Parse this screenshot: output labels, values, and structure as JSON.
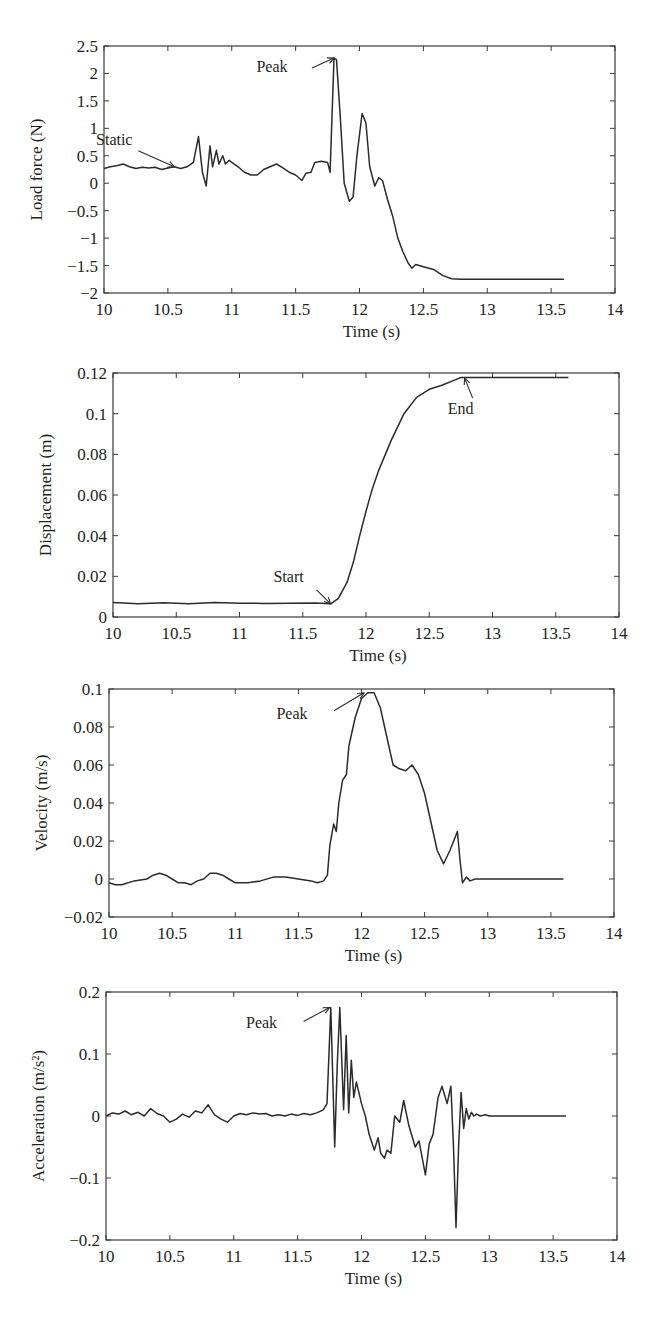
{
  "chart_data": [
    {
      "type": "line",
      "title": "",
      "xlabel": "Time (s)",
      "ylabel": "Load force (N)",
      "xlim": [
        10,
        14
      ],
      "ylim": [
        -2,
        2.5
      ],
      "xticks": [
        "10",
        "10.5",
        "11",
        "11.5",
        "12",
        "12.5",
        "13",
        "13.5",
        "14"
      ],
      "yticks": [
        "-2",
        "-1.5",
        "-1",
        "-0.5",
        "0",
        "0.5",
        "1",
        "1.5",
        "2",
        "2.5"
      ],
      "grid": false,
      "annotations": [
        {
          "text": "Static",
          "x": 10.55,
          "y": 0.3
        },
        {
          "text": "Peak",
          "x": 11.8,
          "y": 2.28
        }
      ],
      "series": [
        {
          "name": "Load force",
          "x": [
            10,
            10.05,
            10.1,
            10.15,
            10.2,
            10.25,
            10.3,
            10.35,
            10.4,
            10.45,
            10.5,
            10.55,
            10.6,
            10.65,
            10.7,
            10.74,
            10.77,
            10.8,
            10.83,
            10.85,
            10.88,
            10.9,
            10.93,
            10.95,
            10.98,
            11.0,
            11.05,
            11.1,
            11.15,
            11.2,
            11.25,
            11.3,
            11.35,
            11.4,
            11.45,
            11.5,
            11.55,
            11.58,
            11.62,
            11.65,
            11.7,
            11.75,
            11.77,
            11.8,
            11.82,
            11.85,
            11.88,
            11.92,
            11.95,
            11.98,
            12.02,
            12.05,
            12.08,
            12.12,
            12.15,
            12.18,
            12.22,
            12.26,
            12.3,
            12.34,
            12.38,
            12.41,
            12.44,
            12.5,
            12.58,
            12.65,
            12.72,
            12.8,
            13.0,
            13.2,
            13.4,
            13.6
          ],
          "y": [
            0.27,
            0.3,
            0.32,
            0.35,
            0.3,
            0.27,
            0.29,
            0.28,
            0.29,
            0.25,
            0.28,
            0.3,
            0.27,
            0.3,
            0.38,
            0.85,
            0.2,
            -0.05,
            0.68,
            0.3,
            0.6,
            0.35,
            0.5,
            0.35,
            0.42,
            0.38,
            0.3,
            0.2,
            0.15,
            0.15,
            0.25,
            0.3,
            0.35,
            0.28,
            0.2,
            0.15,
            0.05,
            0.18,
            0.2,
            0.38,
            0.4,
            0.38,
            0.2,
            2.28,
            2.25,
            1.2,
            0.0,
            -0.33,
            -0.25,
            0.5,
            1.27,
            1.1,
            0.3,
            -0.05,
            0.1,
            0.05,
            -0.3,
            -0.6,
            -1.0,
            -1.25,
            -1.45,
            -1.55,
            -1.48,
            -1.52,
            -1.57,
            -1.68,
            -1.74,
            -1.75,
            -1.75,
            -1.75,
            -1.75,
            -1.75
          ]
        }
      ]
    },
    {
      "type": "line",
      "title": "",
      "xlabel": "Time (s)",
      "ylabel": "Displacement (m)",
      "xlim": [
        10,
        14
      ],
      "ylim": [
        0,
        0.12
      ],
      "xticks": [
        "10",
        "10.5",
        "11",
        "11.5",
        "12",
        "12.5",
        "13",
        "13.5",
        "14"
      ],
      "yticks": [
        "0",
        "0.02",
        "0.04",
        "0.06",
        "0.08",
        "0.1",
        "0.12"
      ],
      "grid": false,
      "annotations": [
        {
          "text": "Start",
          "x": 11.72,
          "y": 0.0065
        },
        {
          "text": "End",
          "x": 12.78,
          "y": 0.1175
        }
      ],
      "series": [
        {
          "name": "Displacement",
          "x": [
            10,
            10.2,
            10.4,
            10.6,
            10.8,
            11.0,
            11.2,
            11.4,
            11.6,
            11.72,
            11.78,
            11.85,
            11.9,
            11.95,
            12.0,
            12.05,
            12.1,
            12.2,
            12.3,
            12.4,
            12.5,
            12.55,
            12.6,
            12.7,
            12.75,
            12.8,
            13.0,
            13.6
          ],
          "y": [
            0.0072,
            0.0065,
            0.007,
            0.0065,
            0.0072,
            0.0068,
            0.0067,
            0.0068,
            0.0069,
            0.0065,
            0.009,
            0.017,
            0.027,
            0.04,
            0.052,
            0.063,
            0.072,
            0.087,
            0.1,
            0.108,
            0.112,
            0.113,
            0.114,
            0.1165,
            0.1178,
            0.1178,
            0.1178,
            0.1178
          ]
        }
      ]
    },
    {
      "type": "line",
      "title": "",
      "xlabel": "Time (s)",
      "ylabel": "Velocity (m/s)",
      "xlim": [
        10,
        14
      ],
      "ylim": [
        -0.02,
        0.1
      ],
      "xticks": [
        "10",
        "10.5",
        "11",
        "11.5",
        "12",
        "12.5",
        "13",
        "13.5",
        "14"
      ],
      "yticks": [
        "-0.02",
        "0",
        "0.02",
        "0.04",
        "0.06",
        "0.08",
        "0.1"
      ],
      "grid": false,
      "annotations": [
        {
          "text": "Peak",
          "x": 12.02,
          "y": 0.098
        }
      ],
      "series": [
        {
          "name": "Velocity",
          "x": [
            10,
            10.05,
            10.1,
            10.2,
            10.3,
            10.35,
            10.4,
            10.45,
            10.5,
            10.55,
            10.6,
            10.65,
            10.7,
            10.75,
            10.8,
            10.85,
            10.9,
            10.95,
            11.0,
            11.05,
            11.1,
            11.2,
            11.3,
            11.4,
            11.5,
            11.6,
            11.65,
            11.7,
            11.73,
            11.75,
            11.78,
            11.8,
            11.82,
            11.85,
            11.88,
            11.9,
            11.95,
            12.0,
            12.05,
            12.1,
            12.15,
            12.2,
            12.25,
            12.3,
            12.35,
            12.4,
            12.45,
            12.5,
            12.55,
            12.6,
            12.65,
            12.7,
            12.73,
            12.76,
            12.78,
            12.8,
            12.83,
            12.86,
            12.9,
            13.0,
            13.2,
            13.4,
            13.6
          ],
          "y": [
            -0.002,
            -0.003,
            -0.003,
            -0.001,
            0.0,
            0.002,
            0.003,
            0.002,
            0.0,
            -0.002,
            -0.002,
            -0.003,
            -0.001,
            0.0,
            0.003,
            0.003,
            0.002,
            0.0,
            -0.002,
            -0.002,
            -0.002,
            -0.001,
            0.001,
            0.001,
            0.0,
            -0.001,
            -0.002,
            -0.001,
            0.002,
            0.018,
            0.029,
            0.025,
            0.04,
            0.052,
            0.055,
            0.07,
            0.085,
            0.095,
            0.098,
            0.098,
            0.09,
            0.075,
            0.06,
            0.058,
            0.057,
            0.06,
            0.055,
            0.045,
            0.03,
            0.015,
            0.008,
            0.015,
            0.02,
            0.025,
            0.01,
            -0.002,
            0.001,
            -0.001,
            0.0,
            0.0,
            0.0,
            0.0,
            0.0
          ]
        }
      ]
    },
    {
      "type": "line",
      "title": "",
      "xlabel": "Time (s)",
      "ylabel": "Acceleration (m/s²)",
      "xlim": [
        10,
        14
      ],
      "ylim": [
        -0.2,
        0.2
      ],
      "xticks": [
        "10",
        "10.5",
        "11",
        "11.5",
        "12",
        "12.5",
        "13",
        "13.5",
        "14"
      ],
      "yticks": [
        "-0.2",
        "-0.1",
        "0",
        "0.1",
        "0.2"
      ],
      "grid": false,
      "annotations": [
        {
          "text": "Peak",
          "x": 11.75,
          "y": 0.175
        }
      ],
      "series": [
        {
          "name": "Acceleration",
          "x": [
            10,
            10.05,
            10.1,
            10.15,
            10.2,
            10.25,
            10.3,
            10.35,
            10.4,
            10.45,
            10.5,
            10.55,
            10.6,
            10.65,
            10.7,
            10.75,
            10.8,
            10.85,
            10.9,
            10.95,
            11.0,
            11.05,
            11.1,
            11.15,
            11.2,
            11.25,
            11.3,
            11.35,
            11.4,
            11.45,
            11.5,
            11.55,
            11.6,
            11.65,
            11.7,
            11.73,
            11.76,
            11.79,
            11.81,
            11.83,
            11.86,
            11.88,
            11.9,
            11.92,
            11.94,
            11.96,
            12.0,
            12.03,
            12.06,
            12.1,
            12.13,
            12.15,
            12.18,
            12.2,
            12.23,
            12.26,
            12.3,
            12.33,
            12.37,
            12.42,
            12.45,
            12.5,
            12.53,
            12.56,
            12.6,
            12.63,
            12.67,
            12.7,
            12.72,
            12.74,
            12.76,
            12.78,
            12.8,
            12.82,
            12.84,
            12.86,
            12.88,
            12.9,
            12.93,
            12.97,
            13.0,
            13.2,
            13.4,
            13.6
          ],
          "y": [
            0.0,
            0.005,
            0.003,
            0.008,
            0.002,
            0.006,
            0.0,
            0.012,
            0.004,
            0.0,
            -0.01,
            -0.005,
            0.003,
            -0.002,
            0.008,
            0.005,
            0.018,
            0.002,
            -0.005,
            -0.01,
            0.0,
            0.004,
            0.002,
            0.005,
            0.003,
            0.004,
            0.0,
            0.002,
            0.0,
            0.003,
            0.001,
            0.004,
            0.002,
            0.005,
            0.01,
            0.02,
            0.175,
            -0.05,
            0.08,
            0.175,
            0.01,
            0.13,
            0.005,
            0.09,
            0.03,
            0.055,
            0.02,
            0.0,
            -0.03,
            -0.055,
            -0.035,
            -0.06,
            -0.068,
            -0.055,
            -0.06,
            0.0,
            -0.01,
            0.025,
            -0.015,
            -0.05,
            -0.04,
            -0.095,
            -0.045,
            -0.03,
            0.03,
            0.048,
            0.02,
            0.048,
            -0.05,
            -0.18,
            -0.05,
            0.038,
            -0.02,
            0.012,
            -0.005,
            0.006,
            0.0,
            0.003,
            0.0,
            0.002,
            0.0,
            0.0,
            0.0,
            0.0
          ]
        }
      ]
    }
  ],
  "layout": {
    "frames": [
      {
        "left": 104,
        "top": 46,
        "right": 615,
        "bottom": 293
      },
      {
        "left": 113,
        "top": 373,
        "right": 619,
        "bottom": 617
      },
      {
        "left": 109,
        "top": 689,
        "right": 614,
        "bottom": 917
      },
      {
        "left": 106,
        "top": 992,
        "right": 617,
        "bottom": 1240
      }
    ]
  }
}
